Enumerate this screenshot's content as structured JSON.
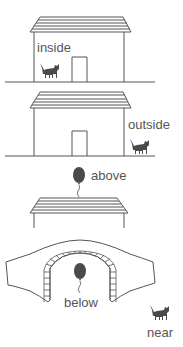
{
  "labels": {
    "inside": "inside",
    "outside": "outside",
    "above": "above",
    "below": "below",
    "near": "near"
  },
  "colors": {
    "line": "#555555",
    "fill_dark": "#4a4a4a",
    "text": "#555555",
    "background": "#ffffff"
  },
  "scenes": [
    {
      "name": "inside",
      "description": "cat inside house"
    },
    {
      "name": "outside",
      "description": "cat outside house"
    },
    {
      "name": "above",
      "description": "balloon above roof"
    },
    {
      "name": "below",
      "description": "balloon below bridge"
    },
    {
      "name": "near",
      "description": "cat near"
    }
  ]
}
